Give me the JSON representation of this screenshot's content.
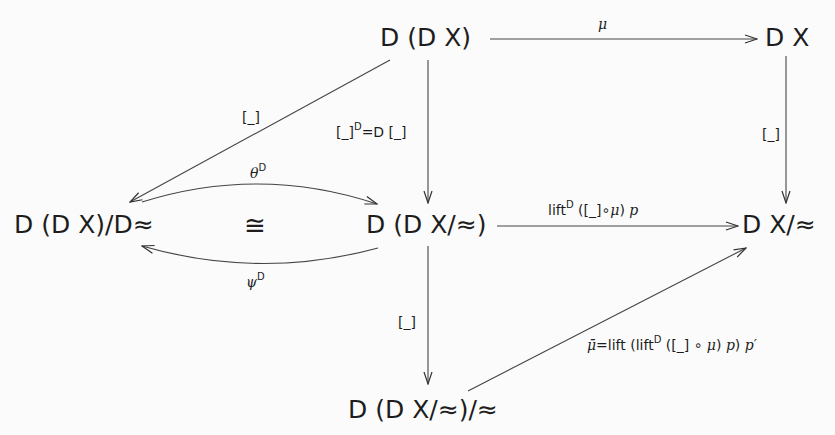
{
  "diagram": {
    "type": "commutative-diagram",
    "nodes": {
      "top_middle": "D (D X)",
      "top_right": "D X",
      "middle_left": "D (D X)/D≈",
      "middle_center": "D (D X/≈)",
      "middle_right": "D X/≈",
      "bottom": "D (D X/≈)/≈"
    },
    "iso_symbol": "≅",
    "labels": {
      "mu": "μ",
      "quot_top_left": "[_]",
      "quot_right": "[_]",
      "quot_center_a": "[_]",
      "quot_center_sup": "D",
      "quot_center_b": "=D [_]",
      "theta": "θ",
      "theta_sup": "D",
      "psi": "ψ",
      "psi_sup": "D",
      "lift_a": "lift",
      "lift_sup": "D",
      "lift_b": " ([_]∘",
      "lift_mu": "μ",
      "lift_c": ") ",
      "lift_p": "p",
      "quot_bottom": "[_]",
      "mubar": "μ̄",
      "mubar_a": "=lift (lift",
      "mubar_sup": "D",
      "mubar_b": " ([_] ∘ ",
      "mubar_mu": "μ",
      "mubar_c": ") ",
      "mubar_p": "p",
      "mubar_d": ") ",
      "mubar_pprime": "p′"
    },
    "edges": [
      {
        "from": "top_middle",
        "to": "top_right",
        "label": "μ"
      },
      {
        "from": "top_middle",
        "to": "middle_left",
        "label": "[_]"
      },
      {
        "from": "top_middle",
        "to": "middle_center",
        "label": "[_]^D = D [_]"
      },
      {
        "from": "top_right",
        "to": "middle_right",
        "label": "[_]"
      },
      {
        "from": "middle_left",
        "to": "middle_center",
        "label": "θ^D",
        "curved": true
      },
      {
        "from": "middle_center",
        "to": "middle_left",
        "label": "ψ^D",
        "curved": true
      },
      {
        "from": "middle_center",
        "to": "middle_right",
        "label": "lift^D ([_]∘μ) p"
      },
      {
        "from": "middle_center",
        "to": "bottom",
        "label": "[_]"
      },
      {
        "from": "bottom",
        "to": "middle_right",
        "label": "μ̄ = lift (lift^D ([_] ∘ μ) p) p′"
      }
    ]
  }
}
